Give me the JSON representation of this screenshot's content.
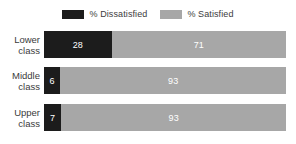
{
  "chart_data": {
    "type": "bar",
    "orientation": "horizontal",
    "stacked": true,
    "title": "",
    "subtitle": "",
    "xlabel": "",
    "ylabel": "",
    "xlim": [
      0,
      100
    ],
    "grid": false,
    "legend_position": "top-center",
    "categories": [
      "Lower class",
      "Middle class",
      "Upper class"
    ],
    "series": [
      {
        "name": "% Dissatisfied",
        "color": "#1c1c1c",
        "values": [
          28,
          6,
          7
        ]
      },
      {
        "name": "% Satisfied",
        "color": "#a7a7a7",
        "values": [
          71,
          93,
          93
        ]
      }
    ]
  },
  "legend": {
    "items": [
      {
        "label": "% Dissatisfied",
        "color": "#1c1c1c",
        "swatch_name": "legend-swatch-dissatisfied"
      },
      {
        "label": "% Satisfied",
        "color": "#a7a7a7",
        "swatch_name": "legend-swatch-satisfied"
      }
    ]
  },
  "rows": [
    {
      "label_line1": "Lower",
      "label_line2": "class",
      "dissatisfied_value": "28",
      "satisfied_value": "71",
      "dissatisfied_pct": 28,
      "satisfied_pct": 72
    },
    {
      "label_line1": "Middle",
      "label_line2": "class",
      "dissatisfied_value": "6",
      "satisfied_value": "93",
      "dissatisfied_pct": 6.8,
      "satisfied_pct": 93.2
    },
    {
      "label_line1": "Upper",
      "label_line2": "class",
      "dissatisfied_value": "7",
      "satisfied_value": "93",
      "dissatisfied_pct": 7.2,
      "satisfied_pct": 92.8
    }
  ],
  "colors": {
    "dissatisfied": "#1c1c1c",
    "satisfied": "#a7a7a7",
    "background": "#ffffff",
    "text": "#3b3b3b",
    "value_text": "#ffffff"
  }
}
